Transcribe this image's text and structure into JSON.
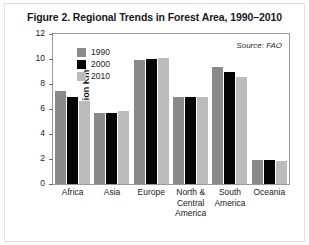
{
  "figure": {
    "title": "Figure 2. Regional Trends in Forest Area, 1990–2010",
    "source_note": "Source: FAO"
  },
  "chart_data": {
    "type": "bar",
    "title": "Figure 2. Regional Trends in Forest Area, 1990–2010",
    "xlabel": "",
    "ylabel": "Million Km²",
    "ylim": [
      0,
      12
    ],
    "yticks": [
      0,
      2,
      4,
      6,
      8,
      10,
      12
    ],
    "ytick_labels": [
      "0",
      "2",
      "4",
      "6",
      "8",
      "10",
      "12"
    ],
    "grid": false,
    "legend_position": "top-left inside",
    "annotations": [
      "Source: FAO"
    ],
    "categories": [
      "Africa",
      "Asia",
      "Europe",
      "North & Central America",
      "South America",
      "Oceania"
    ],
    "series": [
      {
        "name": "1990",
        "color": "#8a8a8a",
        "values": [
          7.45,
          5.7,
          9.9,
          7.0,
          9.4,
          1.9
        ]
      },
      {
        "name": "2000",
        "color": "#050505",
        "values": [
          7.0,
          5.65,
          10.0,
          7.0,
          9.0,
          1.9
        ]
      },
      {
        "name": "2010",
        "color": "#bcbcbc",
        "values": [
          6.65,
          5.85,
          10.05,
          7.0,
          8.55,
          1.85
        ]
      }
    ]
  },
  "legend": {
    "items": [
      {
        "label": "1990"
      },
      {
        "label": "2000"
      },
      {
        "label": "2010"
      }
    ]
  },
  "axes": {
    "y_label": "Million Km²",
    "y_ticks": [
      "12",
      "10",
      "8",
      "6",
      "4",
      "2",
      "0"
    ]
  },
  "x_labels": [
    {
      "lines": [
        "Africa"
      ]
    },
    {
      "lines": [
        "Asia"
      ]
    },
    {
      "lines": [
        "Europe"
      ]
    },
    {
      "lines": [
        "North &",
        "Central",
        "America"
      ]
    },
    {
      "lines": [
        "South",
        "America"
      ]
    },
    {
      "lines": [
        "Oceania"
      ]
    }
  ]
}
